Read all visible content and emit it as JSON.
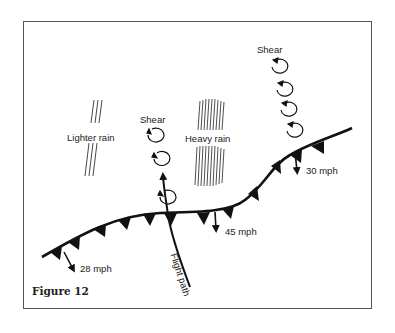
{
  "figure": {
    "caption": "Figure 12",
    "labels": {
      "lighter_rain": "Lighter rain",
      "heavy_rain": "Heavy rain",
      "shear_left": "Shear",
      "shear_right": "Shear",
      "flight_path": "Flight path",
      "wind_28": "28 mph",
      "wind_45": "45 mph",
      "wind_30": "30 mph"
    },
    "colors": {
      "ink": "#111111",
      "frame": "#555555",
      "background": "#ffffff"
    }
  }
}
